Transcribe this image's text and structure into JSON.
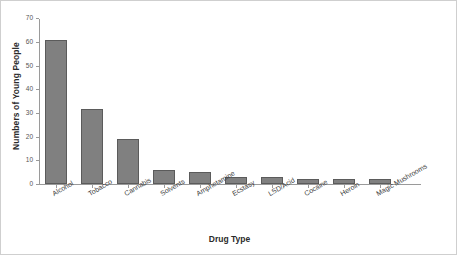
{
  "chart_data": {
    "type": "bar",
    "title": "",
    "xlabel": "Drug Type",
    "ylabel": "Numbers of Young People",
    "categories": [
      "Alcohol",
      "Tobacco",
      "Cannabis",
      "Solvents",
      "Amphetamine",
      "Ecstasy",
      "LSD/Acid",
      "Cocaine",
      "Heroin",
      "Magic Mushrooms"
    ],
    "values": [
      61,
      32,
      19,
      6,
      5,
      3,
      3,
      2,
      2,
      2
    ],
    "ylim": [
      0,
      70
    ],
    "yticks": [
      0,
      10,
      20,
      30,
      40,
      50,
      60,
      70
    ],
    "ytick_labels": [
      "0",
      "10",
      "20",
      "30",
      "40",
      "50",
      "60",
      "70"
    ],
    "grid": false,
    "legend": "none",
    "bar_color": "#808080",
    "bar_edge_color": "#5b5b5b",
    "axis_color": "#9a9a9a",
    "background": "#ffffff"
  }
}
